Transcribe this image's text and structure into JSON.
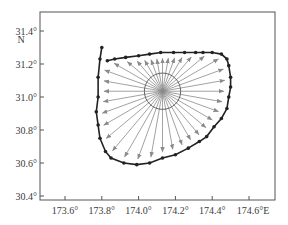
{
  "chart_data": {
    "type": "line",
    "title": "",
    "xlabel": "",
    "ylabel": "",
    "x_ticks": [
      "173.6°",
      "173.8°",
      "174.0°",
      "174.2°",
      "174.4°",
      "174.6°E"
    ],
    "x_tick_values": [
      173.6,
      173.8,
      174.0,
      174.2,
      174.4,
      174.6
    ],
    "y_ticks": [
      "31.4°",
      "31.2°",
      "31.0°",
      "30.8°",
      "30.6°",
      "30.4°"
    ],
    "y_tick_values": [
      31.4,
      31.2,
      31.0,
      30.8,
      30.6,
      30.4
    ],
    "y_unit_label": "N",
    "xlim": [
      173.45,
      174.72
    ],
    "ylim": [
      30.37,
      31.52
    ],
    "grid": false,
    "legend": null,
    "center": {
      "lon": 174.13,
      "lat": 31.035,
      "circle_radius_deg_lat": 0.11
    },
    "boundary_series": {
      "name": "boundary",
      "color": "#222222",
      "markers": true,
      "points": [
        [
          173.8,
          31.3
        ],
        [
          173.79,
          31.23
        ],
        [
          173.78,
          31.12
        ],
        [
          173.78,
          31.0
        ],
        [
          173.77,
          30.91
        ],
        [
          173.78,
          30.83
        ],
        [
          173.79,
          30.75
        ],
        [
          173.82,
          30.67
        ],
        [
          173.85,
          30.63
        ],
        [
          173.92,
          30.6
        ],
        [
          173.99,
          30.59
        ],
        [
          174.06,
          30.6
        ],
        [
          174.13,
          30.63
        ],
        [
          174.2,
          30.65
        ],
        [
          174.27,
          30.69
        ],
        [
          174.33,
          30.73
        ],
        [
          174.37,
          30.76
        ],
        [
          174.41,
          30.82
        ],
        [
          174.45,
          30.87
        ],
        [
          174.48,
          30.93
        ],
        [
          174.49,
          31.0
        ],
        [
          174.5,
          31.06
        ],
        [
          174.5,
          31.12
        ],
        [
          174.49,
          31.19
        ],
        [
          174.48,
          31.23
        ],
        [
          174.45,
          31.26
        ],
        [
          174.4,
          31.27
        ],
        [
          174.35,
          31.27
        ],
        [
          174.31,
          31.27
        ],
        [
          174.25,
          31.27
        ],
        [
          174.19,
          31.27
        ],
        [
          174.12,
          31.27
        ],
        [
          174.06,
          31.26
        ],
        [
          174.0,
          31.25
        ],
        [
          173.93,
          31.24
        ],
        [
          173.87,
          31.23
        ],
        [
          173.83,
          31.22
        ]
      ]
    },
    "rays": {
      "color": "#8a8a8a",
      "count": 36,
      "description": "Arrows radiating from center to boundary in all directions"
    }
  },
  "axes": {
    "frame": {
      "left": 40,
      "top": 12,
      "right": 275,
      "bottom": 200
    }
  }
}
